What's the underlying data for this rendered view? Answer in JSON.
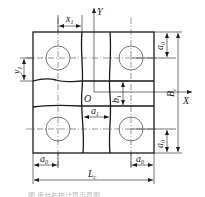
{
  "diagram": {
    "axes": {
      "x_label": "X",
      "y_label": "Y",
      "origin_label": "O"
    },
    "dimensions": {
      "x1": {
        "main": "x",
        "sub": "1"
      },
      "y1": {
        "main": "y",
        "sub": "1"
      },
      "a0_top_right": {
        "main": "a",
        "sub": "0"
      },
      "a0_bottom_right": {
        "main": "a",
        "sub": "0"
      },
      "a0_bottom_left": {
        "main": "a",
        "sub": "0"
      },
      "a0_bottom_right_h": {
        "main": "a",
        "sub": "0"
      },
      "b1": {
        "main": "b",
        "sub": "1"
      },
      "a1": {
        "main": "a",
        "sub": "1"
      },
      "Bc": {
        "main": "B",
        "sub": "c"
      },
      "Lc": {
        "main": "L",
        "sub": "c"
      }
    },
    "caption": "图  承台布桩计算示意图"
  }
}
